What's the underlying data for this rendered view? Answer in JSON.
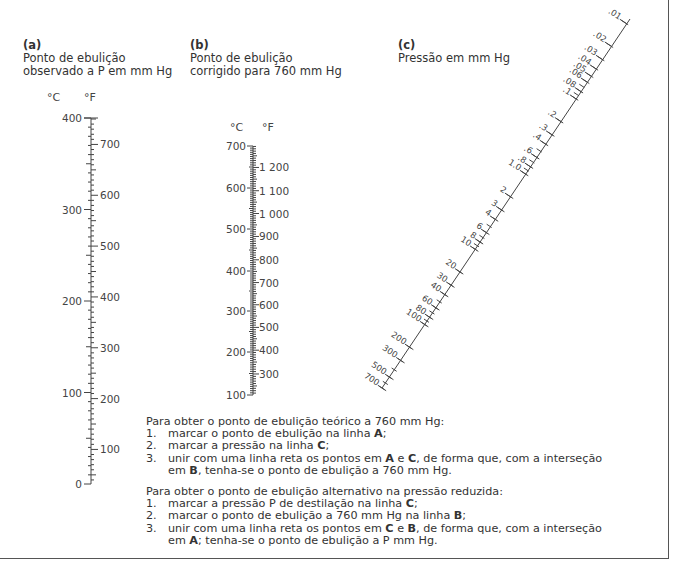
{
  "headings": {
    "a": {
      "tag": "(a)",
      "line1": "Ponto de ebulição",
      "line2": "observado a P em mm Hg"
    },
    "b": {
      "tag": "(b)",
      "line1": "Ponto de ebulição",
      "line2": "corrigido para 760 mm Hg"
    },
    "c": {
      "tag": "(c)",
      "line1": "Pressão em mm Hg"
    }
  },
  "scale_a": {
    "unit_c": "°C",
    "unit_f": "°F",
    "celsius_labels": [
      "400",
      "300",
      "200",
      "100",
      "0"
    ],
    "fahrenheit_labels": [
      "700",
      "600",
      "500",
      "400",
      "300",
      "200",
      "100"
    ]
  },
  "scale_b": {
    "unit_c": "°C",
    "unit_f": "°F",
    "celsius_labels": [
      "700",
      "600",
      "500",
      "400",
      "300",
      "200",
      "100"
    ],
    "fahrenheit_labels": [
      "1 200",
      "1 100",
      "1 000",
      "900",
      "800",
      "700",
      "600",
      "500",
      "400",
      "300"
    ]
  },
  "scale_c": {
    "labels": [
      ".01",
      ".02",
      ".03",
      ".04",
      ".05",
      ".06",
      ".08",
      ".1",
      ".2",
      ".3",
      ".4",
      ".6",
      ".8",
      "1.0",
      "2",
      "3",
      "4",
      "6",
      "8",
      "10",
      "20",
      "30",
      "40",
      "60",
      "80",
      "100",
      "200",
      "300",
      "500",
      "700"
    ]
  },
  "instructions": {
    "theoretical": {
      "title": "Para obter o ponto de ebulição teórico a 760 mm Hg:",
      "steps": [
        {
          "num": "1.",
          "pre": "marcar o ponto de ebulição na linha ",
          "b1": "A",
          "mid": ";",
          "b2": "",
          "post": ""
        },
        {
          "num": "2.",
          "pre": "marcar a pressão na linha ",
          "b1": "C",
          "mid": ";",
          "b2": "",
          "post": ""
        },
        {
          "num": "3.",
          "pre": "unir com uma linha reta os pontos em ",
          "b1": "A",
          "mid": " e ",
          "b2": "C",
          "post": ", de forma que, com a interseção",
          "cont_pre": "em ",
          "cont_b": "B",
          "cont_post": ", tenha-se o ponto de ebulição a 760 mm Hg."
        }
      ]
    },
    "alternative": {
      "title": "Para obter o ponto de ebulição alternativo na pressão reduzida:",
      "steps": [
        {
          "num": "1.",
          "pre": "marcar a pressão P de destilação na linha ",
          "b1": "C",
          "mid": ";",
          "b2": "",
          "post": ""
        },
        {
          "num": "2.",
          "pre": "marcar o ponto de ebulição a 760 mm Hg na linha ",
          "b1": "B",
          "mid": ";",
          "b2": "",
          "post": ""
        },
        {
          "num": "3.",
          "pre": "unir com uma linha reta os pontos em ",
          "b1": "C",
          "mid": " e ",
          "b2": "B",
          "post": ", de forma que, com a interseção",
          "cont_pre": "em ",
          "cont_b": "A",
          "cont_post": "; tenha-se o ponto de ebulição a P mm Hg."
        }
      ]
    }
  }
}
